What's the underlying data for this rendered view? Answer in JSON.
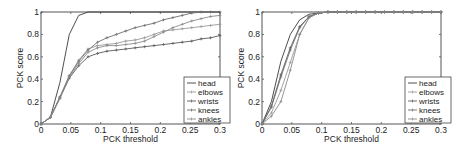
{
  "chart_data": [
    {
      "type": "line",
      "title": "",
      "xlabel": "PCK threshold",
      "ylabel": "PCK score",
      "xlim": [
        0,
        0.3
      ],
      "ylim": [
        0,
        1
      ],
      "xticks": [
        "0",
        "0.05",
        "0.1",
        "0.15",
        "0.2",
        "0.25",
        "0.3"
      ],
      "yticks": [
        "0",
        "0.2",
        "0.4",
        "0.6",
        "0.8",
        "1"
      ],
      "grid": false,
      "legend_position": "lower right",
      "x": [
        0,
        0.0158,
        0.0316,
        0.0474,
        0.0632,
        0.0789,
        0.0947,
        0.1105,
        0.1263,
        0.1421,
        0.1579,
        0.1737,
        0.1895,
        0.2053,
        0.2211,
        0.2368,
        0.2526,
        0.2684,
        0.2842,
        0.3
      ],
      "series": [
        {
          "name": "head",
          "color": "#3a3a3a",
          "values": [
            0,
            0.06,
            0.37,
            0.8,
            0.97,
            1.0,
            1.0,
            1.0,
            1.0,
            1.0,
            1.0,
            1.0,
            1.0,
            1.0,
            1.0,
            1.0,
            1.0,
            1.0,
            1.0,
            1.0
          ]
        },
        {
          "name": "elbows",
          "color": "#9a9a9a",
          "values": [
            0,
            0.06,
            0.24,
            0.43,
            0.57,
            0.67,
            0.7,
            0.71,
            0.72,
            0.74,
            0.75,
            0.77,
            0.8,
            0.83,
            0.84,
            0.85,
            0.86,
            0.87,
            0.88,
            0.89
          ]
        },
        {
          "name": "wrists",
          "color": "#5a5a5a",
          "values": [
            0,
            0.06,
            0.23,
            0.41,
            0.52,
            0.6,
            0.63,
            0.65,
            0.66,
            0.67,
            0.68,
            0.69,
            0.7,
            0.71,
            0.72,
            0.73,
            0.74,
            0.76,
            0.77,
            0.79
          ]
        },
        {
          "name": "knees",
          "color": "#6e6e6e",
          "values": [
            0,
            0.06,
            0.24,
            0.43,
            0.56,
            0.66,
            0.73,
            0.77,
            0.8,
            0.83,
            0.86,
            0.88,
            0.9,
            0.93,
            0.95,
            0.97,
            0.99,
            1.0,
            1.0,
            1.0
          ]
        },
        {
          "name": "ankles",
          "color": "#8a8a8a",
          "values": [
            0,
            0.06,
            0.23,
            0.42,
            0.54,
            0.64,
            0.68,
            0.7,
            0.7,
            0.71,
            0.72,
            0.74,
            0.78,
            0.82,
            0.86,
            0.89,
            0.92,
            0.94,
            0.96,
            0.97
          ]
        }
      ]
    },
    {
      "type": "line",
      "title": "",
      "xlabel": "PCK threshold",
      "ylabel": "PCK score",
      "xlim": [
        0,
        0.3
      ],
      "ylim": [
        0,
        1
      ],
      "xticks": [
        "0",
        "0.05",
        "0.1",
        "0.15",
        "0.2",
        "0.25",
        "0.3"
      ],
      "yticks": [
        "0",
        "0.2",
        "0.4",
        "0.6",
        "0.8",
        "1"
      ],
      "grid": false,
      "legend_position": "lower right",
      "x": [
        0,
        0.0158,
        0.0316,
        0.0474,
        0.0632,
        0.0789,
        0.0947,
        0.1105,
        0.1263,
        0.1421,
        0.1579,
        0.1737,
        0.1895,
        0.2053,
        0.2211,
        0.2368,
        0.2526,
        0.2684,
        0.2842,
        0.3
      ],
      "series": [
        {
          "name": "head",
          "color": "#3a3a3a",
          "values": [
            0,
            0.2,
            0.56,
            0.8,
            0.93,
            0.98,
            0.99,
            1.0,
            1.0,
            1.0,
            1.0,
            1.0,
            1.0,
            1.0,
            1.0,
            1.0,
            1.0,
            1.0,
            1.0,
            1.0
          ]
        },
        {
          "name": "elbows",
          "color": "#9a9a9a",
          "values": [
            0,
            0.1,
            0.3,
            0.55,
            0.8,
            0.95,
            0.99,
            1.0,
            1.0,
            1.0,
            1.0,
            1.0,
            1.0,
            1.0,
            1.0,
            1.0,
            1.0,
            1.0,
            1.0,
            1.0
          ]
        },
        {
          "name": "wrists",
          "color": "#5a5a5a",
          "values": [
            0,
            0.16,
            0.44,
            0.68,
            0.87,
            0.96,
            0.99,
            1.0,
            1.0,
            1.0,
            1.0,
            1.0,
            1.0,
            1.0,
            1.0,
            1.0,
            1.0,
            1.0,
            1.0,
            1.0
          ]
        },
        {
          "name": "knees",
          "color": "#6e6e6e",
          "values": [
            0,
            0.15,
            0.42,
            0.66,
            0.86,
            0.96,
            0.99,
            1.0,
            1.0,
            1.0,
            1.0,
            1.0,
            1.0,
            1.0,
            1.0,
            1.0,
            1.0,
            1.0,
            1.0,
            1.0
          ]
        },
        {
          "name": "ankles",
          "color": "#8a8a8a",
          "values": [
            0,
            0.07,
            0.2,
            0.48,
            0.8,
            0.95,
            0.99,
            1.0,
            1.0,
            1.0,
            1.0,
            1.0,
            1.0,
            1.0,
            1.0,
            1.0,
            1.0,
            1.0,
            1.0,
            1.0
          ]
        }
      ]
    }
  ]
}
